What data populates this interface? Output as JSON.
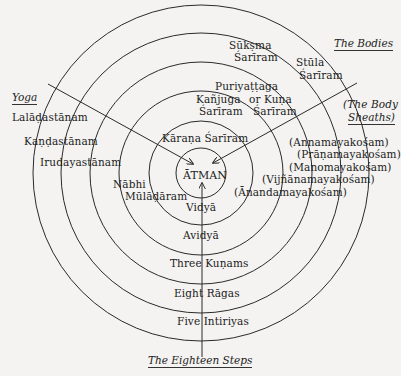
{
  "diagram": {
    "center_label": "ĀTMAN",
    "headers": {
      "bodies": "The Bodies",
      "yoga": "Yoga",
      "sheaths_line1": "(The Body",
      "sheaths_line2": "Sheaths)",
      "steps": "The Eighteen Steps"
    },
    "bodies": {
      "suksma_1": "Sūkṣma",
      "suksma_2": "Śarīram",
      "stula_1": "Stūla",
      "stula_2": "Śarīram",
      "puriyattaga": "Puriyaṭṭaga",
      "kanjuga_1": "Kañjuga",
      "kanjuga_2": "Śarīram",
      "kuna_1": "or Kuṇa",
      "kuna_2": "Śarīram",
      "karana": "Kāraṇa Śarīram"
    },
    "yoga": {
      "items": [
        "Lalāḍastānam",
        "Kaṇḍastānam",
        "Irudayastānam",
        "Nābhi",
        "Mūlāḍāram"
      ]
    },
    "sheaths": {
      "items": [
        "(Annamayakośam)",
        "(Prāṇamayakośam)",
        "(Manomayakośam)",
        "(Vijñānamayakośam)",
        "(Ānandamayakośam)"
      ]
    },
    "steps": {
      "items": [
        "Vidyā",
        "Avidyā",
        "Three Kuṇams",
        "Eight Rāgas",
        "Five Intiriyas"
      ]
    },
    "colors": {
      "background": "#f4f3f1",
      "line": "#2a2a2a",
      "text": "#222222"
    }
  }
}
